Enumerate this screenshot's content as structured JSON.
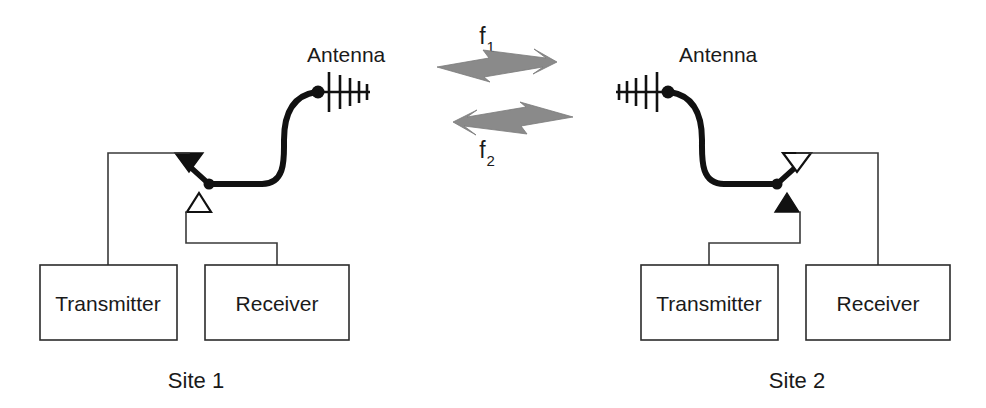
{
  "diagram": {
    "colors": {
      "ink": "#111111",
      "wire": "#3a3a3a",
      "box_stroke": "#2b2b2b",
      "box_fill": "#ffffff",
      "arrow_gray": "#8a8a8a",
      "background": "#ffffff"
    }
  },
  "sites": [
    {
      "id": "site-1",
      "label": "Site 1",
      "antenna_label": "Antenna",
      "antenna_orientation": "right",
      "switch": {
        "upper_contact": "filled",
        "lower_contact": "open",
        "upper_contact_connects_to": "Transmitter",
        "lower_contact_connects_to": "Receiver",
        "arm_position": "upper"
      },
      "boxes": [
        {
          "id": "site-1-transmitter",
          "label": "Transmitter"
        },
        {
          "id": "site-1-receiver",
          "label": "Receiver"
        }
      ]
    },
    {
      "id": "site-2",
      "label": "Site 2",
      "antenna_label": "Antenna",
      "antenna_orientation": "left",
      "switch": {
        "upper_contact": "open",
        "lower_contact": "filled",
        "upper_contact_connects_to": "Receiver",
        "lower_contact_connects_to": "Transmitter",
        "arm_position": "upper"
      },
      "boxes": [
        {
          "id": "site-2-transmitter",
          "label": "Transmitter"
        },
        {
          "id": "site-2-receiver",
          "label": "Receiver"
        }
      ]
    }
  ],
  "links": [
    {
      "id": "link-f1",
      "base": "f",
      "subscript": "1",
      "direction": "right",
      "description": "Site 1 transmits to Site 2 on f1"
    },
    {
      "id": "link-f2",
      "base": "f",
      "subscript": "2",
      "direction": "left",
      "description": "Site 2 transmits to Site 1 on f2"
    }
  ]
}
